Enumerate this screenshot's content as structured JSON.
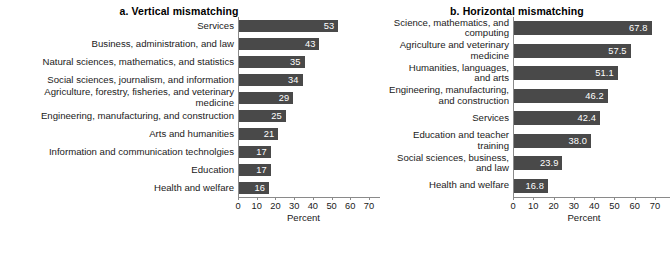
{
  "chart_data": [
    {
      "type": "bar",
      "orientation": "horizontal",
      "panel": "a",
      "title": "a. Vertical mismatching",
      "xlabel": "Percent",
      "ylabel": "",
      "xlim": [
        0,
        70
      ],
      "xticks": [
        0,
        10,
        20,
        30,
        40,
        50,
        60,
        70
      ],
      "grid": false,
      "legend": false,
      "bar_color": "#494949",
      "value_label_color": "#ffffff",
      "categories": [
        "Services",
        "Business, administration, and law",
        "Natural sciences, mathematics, and statistics",
        "Social sciences, journalism, and information",
        "Agriculture, forestry, fisheries, and veterinary\nmedicine",
        "Engineering, manufacturing, and construction",
        "Arts and humanities",
        "Information and communication technolgies",
        "Education",
        "Health and welfare"
      ],
      "values": [
        53,
        43,
        35,
        34,
        29,
        25,
        21,
        17,
        17,
        16
      ],
      "value_labels": [
        "53",
        "43",
        "35",
        "34",
        "29",
        "25",
        "21",
        "17",
        "17",
        "16"
      ]
    },
    {
      "type": "bar",
      "orientation": "horizontal",
      "panel": "b",
      "title": "b. Horizontal mismatching",
      "xlabel": "Percent",
      "ylabel": "",
      "xlim": [
        0,
        70
      ],
      "xticks": [
        0,
        10,
        20,
        30,
        40,
        50,
        60,
        70
      ],
      "grid": false,
      "legend": false,
      "bar_color": "#494949",
      "value_label_color": "#ffffff",
      "categories": [
        "Science, mathematics, and\ncomputing",
        "Agriculture and veterinary\nmedicine",
        "Humanities, languages,\nand arts",
        "Engineering, manufacturing,\nand construction",
        "Services",
        "Education and teacher\ntraining",
        "Social sciences, business,\nand law",
        "Health and welfare"
      ],
      "values": [
        67.8,
        57.5,
        51.1,
        46.2,
        42.4,
        38.0,
        23.9,
        16.8
      ],
      "value_labels": [
        "67.8",
        "57.5",
        "51.1",
        "46.2",
        "42.4",
        "38.0",
        "23.9",
        "16.8"
      ]
    }
  ]
}
